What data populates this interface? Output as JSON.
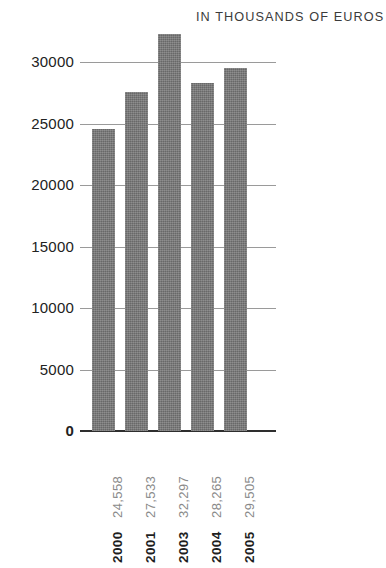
{
  "header": {
    "title": "",
    "subtitle": "IN THOUSANDS OF EUROS"
  },
  "chart_data": {
    "type": "bar",
    "title": "",
    "subtitle": "IN THOUSANDS OF EUROS",
    "xlabel": "",
    "ylabel": "",
    "categories": [
      "2000",
      "2001",
      "2003",
      "2004",
      "2005"
    ],
    "values": [
      24558,
      27533,
      32297,
      28265,
      29505
    ],
    "value_labels": [
      "24,558",
      "27,533",
      "32,297",
      "28,265",
      "29,505"
    ],
    "ylim": [
      0,
      33500
    ],
    "yticks": [
      0,
      5000,
      10000,
      15000,
      20000,
      25000,
      30000
    ],
    "ytick_labels": [
      "0",
      "5000",
      "10000",
      "15000",
      "20000",
      "25000",
      "30000"
    ],
    "grid": true,
    "legend": null,
    "series": [
      {
        "name": "",
        "values": [
          24558,
          27533,
          32297,
          28265,
          29505
        ]
      }
    ],
    "colors": {
      "bar": "#757575",
      "gridline": "#9a9a9a",
      "axis": "#2e2e2e",
      "value_label": "#8a8a8a",
      "year_label": "#1f1f1f",
      "background": "#ffffff"
    }
  }
}
